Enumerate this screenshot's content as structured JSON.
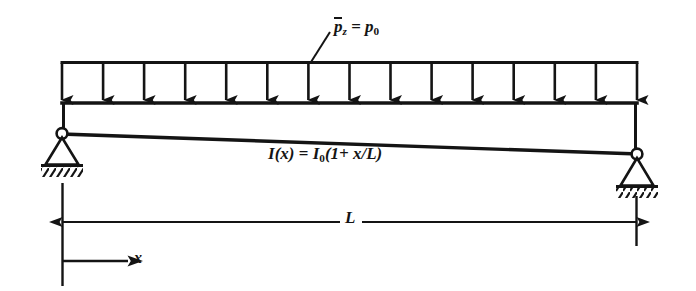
{
  "figure": {
    "type": "structural-beam-diagram",
    "background_color": "#ffffff",
    "ink_color": "#141414"
  },
  "labels": {
    "load": {
      "symbol_overbar": "p",
      "symbol_sub": "z",
      "equals": "=",
      "value_symbol": "p",
      "value_sub": "0",
      "text": "p̄z = p0"
    },
    "inertia": {
      "text": "I(x) = I0(1 + x/L)",
      "lhs": "I",
      "lhs_arg": "(x)",
      "equals": "=",
      "rhs_symbol": "I",
      "rhs_sub": "0",
      "rhs_expr": "(1+ x/L)"
    },
    "span": {
      "text": "L"
    },
    "axis": {
      "text": "x"
    }
  },
  "geometry": {
    "beam": {
      "left_x": 62,
      "right_x": 637,
      "top_y": 103,
      "left_bottom_y": 134,
      "right_bottom_y": 154
    },
    "load_band": {
      "top_y": 62,
      "arrow_count": 15,
      "first_arrow_x": 62,
      "last_arrow_x": 637
    },
    "supports": {
      "left": {
        "x": 62,
        "pin_y": 131,
        "ground_y": 166
      },
      "right": {
        "x": 637,
        "pin_y": 152,
        "ground_y": 187
      }
    },
    "dimension_line": {
      "y": 222,
      "start_x": 62,
      "end_x": 637
    },
    "x_axis_arrow": {
      "y": 261,
      "start_x": 62,
      "end_x": 128
    }
  }
}
